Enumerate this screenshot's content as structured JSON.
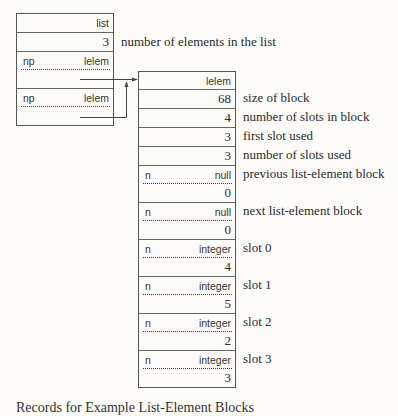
{
  "list_block": {
    "rows": [
      {
        "type": "single",
        "right": "list",
        "font": "sans"
      },
      {
        "type": "single",
        "right": "3",
        "font": "serif",
        "note": "number of elements in the list"
      },
      {
        "type": "single-dotted",
        "left": "np",
        "right": "lelem"
      },
      {
        "type": "single",
        "right": "",
        "pointer": true
      },
      {
        "type": "single-dotted",
        "left": "np",
        "right": "lelem"
      },
      {
        "type": "single",
        "right": "",
        "pointer": true
      }
    ]
  },
  "lelem_block": {
    "header": "lelem",
    "fields": [
      {
        "value": "68",
        "note": "size of block"
      },
      {
        "value": "4",
        "note": "number of slots in block"
      },
      {
        "value": "3",
        "note": "first slot used"
      },
      {
        "value": "3",
        "note": "number of slots used"
      }
    ],
    "pairs": [
      {
        "left": "n",
        "type": "null",
        "value": "0",
        "note": "previous list-element block"
      },
      {
        "left": "n",
        "type": "null",
        "value": "0",
        "note": "next list-element block"
      },
      {
        "left": "n",
        "type": "integer",
        "value": "4",
        "note": "slot 0"
      },
      {
        "left": "n",
        "type": "integer",
        "value": "5",
        "note": "slot 1"
      },
      {
        "left": "n",
        "type": "integer",
        "value": "2",
        "note": "slot 2"
      },
      {
        "left": "n",
        "type": "integer",
        "value": "3",
        "note": "slot 3"
      }
    ]
  },
  "caption": "Records for Example List-Element Blocks"
}
